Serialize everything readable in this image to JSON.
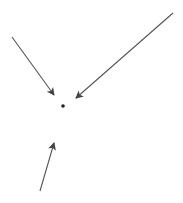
{
  "diagram": {
    "colors": {
      "background": "#ffffff",
      "arrow": "#555555",
      "dot": "#222222"
    },
    "dot": {
      "cx": 63,
      "cy": 106,
      "r": 1.8
    },
    "arrows": [
      {
        "name": "arrow-top-left",
        "x1": 12,
        "y1": 37,
        "x2": 54,
        "y2": 95
      },
      {
        "name": "arrow-top-right",
        "x1": 173,
        "y1": 13,
        "x2": 76,
        "y2": 98
      },
      {
        "name": "arrow-bottom",
        "x1": 40,
        "y1": 191,
        "x2": 54,
        "y2": 143
      }
    ]
  }
}
